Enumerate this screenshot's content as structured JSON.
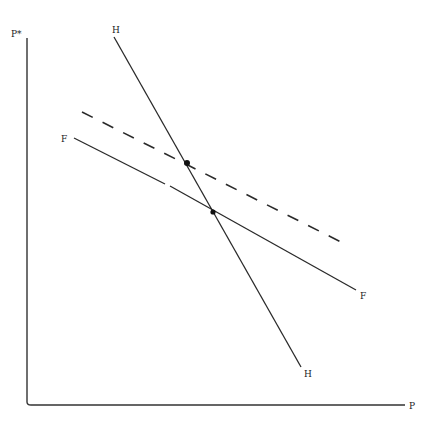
{
  "diagram": {
    "axes": {
      "y_label": "P*",
      "x_label": "P"
    },
    "curves": [
      {
        "id": "H",
        "label_start": "H",
        "label_end": "H",
        "style": "solid",
        "description": "steep downward-sloping line"
      },
      {
        "id": "F",
        "label_start": "F",
        "label_end": "F",
        "style": "solid",
        "description": "shallow downward-sloping line"
      },
      {
        "id": "F_shifted",
        "label_start": "",
        "label_end": "",
        "style": "dashed",
        "description": "F line shifted upward"
      }
    ],
    "points": [
      {
        "id": "intersection_H_F",
        "description": "intersection of H and F"
      },
      {
        "id": "intersection_H_F_shifted",
        "description": "intersection of H and shifted F (dashed)"
      }
    ]
  },
  "colors": {
    "line": "#2a2a2a",
    "background": "#ffffff"
  }
}
